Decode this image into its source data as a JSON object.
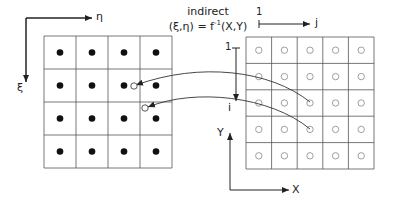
{
  "title": {
    "line1": "indirect",
    "formula_lhs": "(ξ,η) = f",
    "formula_sup": "-1",
    "formula_rhs": "(X,Y)"
  },
  "left_axes": {
    "horizontal_label": "η",
    "vertical_label": "ξ"
  },
  "index_axes": {
    "j_start": "1",
    "j_label": "j",
    "i_start": "1",
    "i_label": "i"
  },
  "physical_axes": {
    "horizontal_label": "X",
    "vertical_label": "Y"
  },
  "left_grid": {
    "rows": 4,
    "cols": 4,
    "marker": "filled-dot",
    "x": 44,
    "y": 36,
    "w": 128,
    "h": 132
  },
  "right_grid": {
    "rows": 5,
    "cols": 5,
    "marker": "open-circle",
    "x": 246,
    "y": 37,
    "w": 128,
    "h": 132
  },
  "mapped_points": [
    {
      "from": [
        310,
        102
      ],
      "to": [
        134,
        86
      ]
    },
    {
      "from": [
        310,
        129
      ],
      "to": [
        145,
        108
      ]
    }
  ],
  "colors": {
    "line": "#222222",
    "grid": "#555555",
    "dot": "#111111",
    "open": "#888888"
  }
}
